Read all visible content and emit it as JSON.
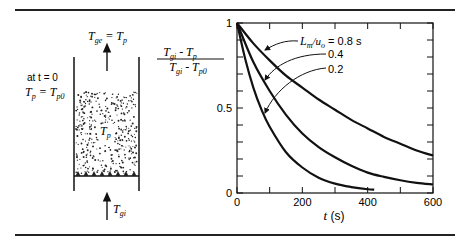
{
  "figure": {
    "schematic": {
      "outlet_label": "T",
      "outlet_sub": "ge",
      "outlet_eq": " = T",
      "outlet_sub2": "p",
      "initial_line1": "at t = 0",
      "initial_line2_main": "T",
      "initial_line2_sub": "p",
      "initial_line2_eq": " = T",
      "initial_line2_sub2": "p0",
      "bed_label_main": "T",
      "bed_label_sub": "p",
      "inlet_label_main": "T",
      "inlet_label_sub": "gi"
    }
  },
  "chart_data": {
    "type": "line",
    "title": "",
    "xlabel": "t (s)",
    "ylabel": "(T_gi - T_p) / (T_gi - T_p0)",
    "ylabel_parts": {
      "num_main": "T",
      "num_sub": "gi",
      "num_mid": " - T",
      "num_sub2": "p",
      "den_main": "T",
      "den_sub": "gi",
      "den_mid": " - T",
      "den_sub2": "p0"
    },
    "xlim": [
      0,
      600
    ],
    "ylim": [
      0,
      1
    ],
    "x_ticks": [
      0,
      200,
      400,
      600
    ],
    "x_tick_labels": [
      "0",
      "200",
      "400",
      "600"
    ],
    "x_minor_ticks": [
      100,
      300,
      500
    ],
    "y_ticks": [
      0,
      0.5,
      1
    ],
    "y_tick_labels": [
      "0",
      "0.5",
      "1"
    ],
    "y_minor_ticks": [
      0.1,
      0.2,
      0.3,
      0.4,
      0.6,
      0.7,
      0.8,
      0.9
    ],
    "grid": false,
    "annotation_prefix": "L_m/u_o = ",
    "series": [
      {
        "name": "0.8 s",
        "label": "0.8 s",
        "x": [
          0,
          50,
          100,
          150,
          200,
          250,
          300,
          350,
          400,
          450,
          500,
          550,
          600
        ],
        "y": [
          1.0,
          0.88,
          0.78,
          0.69,
          0.62,
          0.55,
          0.49,
          0.43,
          0.38,
          0.33,
          0.29,
          0.25,
          0.22
        ]
      },
      {
        "name": "0.4",
        "label": "0.4",
        "x": [
          0,
          50,
          100,
          150,
          200,
          250,
          300,
          350,
          400,
          450,
          500,
          550,
          600
        ],
        "y": [
          1.0,
          0.77,
          0.6,
          0.46,
          0.35,
          0.27,
          0.21,
          0.16,
          0.12,
          0.095,
          0.075,
          0.06,
          0.05
        ]
      },
      {
        "name": "0.2",
        "label": "0.2",
        "x": [
          0,
          25,
          50,
          75,
          100,
          150,
          200,
          250,
          300,
          350,
          400,
          420
        ],
        "y": [
          1.0,
          0.79,
          0.62,
          0.49,
          0.39,
          0.24,
          0.15,
          0.09,
          0.055,
          0.035,
          0.022,
          0.02
        ]
      }
    ]
  }
}
